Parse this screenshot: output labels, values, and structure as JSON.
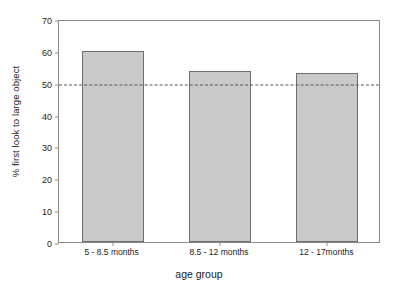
{
  "chart_data": {
    "type": "bar",
    "title": "",
    "categories": [
      "5 - 8.5 months",
      "8.5 - 12 months",
      "12 - 17months"
    ],
    "values": [
      60.0,
      53.7,
      53.1
    ],
    "series": [
      {
        "name": "% first look to large object",
        "values": [
          60.0,
          53.7,
          53.1
        ]
      }
    ],
    "xlabel": "age group",
    "ylabel": "% first look to large object",
    "ylim": [
      0,
      70
    ],
    "ytick_labels": [
      "0",
      "10",
      "20",
      "30",
      "40",
      "50",
      "60",
      "70"
    ],
    "ytick_values": [
      0,
      10,
      20,
      30,
      40,
      50,
      60,
      70
    ],
    "grid": false,
    "legend": false,
    "legend_position": "none",
    "annotations": [
      {
        "type": "reference-line",
        "orientation": "horizontal",
        "value": 50,
        "style": "dashed",
        "color": "#555555",
        "label": ""
      }
    ],
    "bar_fill_color": "#c9c9c9",
    "bar_edge_color": "#6e6e6e",
    "axis_color": "#8a8a8a",
    "background_color": "#ffffff"
  }
}
